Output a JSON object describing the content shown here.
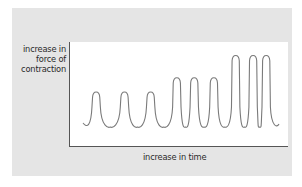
{
  "figure": {
    "y_axis_label_lines": [
      "increase in",
      "force of",
      "contraction"
    ],
    "x_axis_label": "increase in time",
    "colors": {
      "panel_background": "#e5e5e5",
      "plot_background": "#ffffff",
      "axis": "#555555",
      "curve": "#7a7a7a",
      "text": "#2a2a2a"
    }
  },
  "chart_data": {
    "type": "line",
    "title": "",
    "xlabel": "increase in time",
    "ylabel": "increase in force of contraction",
    "grid": false,
    "legend": null,
    "series": [
      {
        "name": "force of contraction",
        "peaks": [
          {
            "index": 1,
            "x_rel": 0.12,
            "height_rel": 0.4
          },
          {
            "index": 2,
            "x_rel": 0.25,
            "height_rel": 0.4
          },
          {
            "index": 3,
            "x_rel": 0.37,
            "height_rel": 0.4
          },
          {
            "index": 4,
            "x_rel": 0.49,
            "height_rel": 0.56
          },
          {
            "index": 5,
            "x_rel": 0.57,
            "height_rel": 0.56
          },
          {
            "index": 6,
            "x_rel": 0.66,
            "height_rel": 0.56
          },
          {
            "index": 7,
            "x_rel": 0.76,
            "height_rel": 0.81
          },
          {
            "index": 8,
            "x_rel": 0.84,
            "height_rel": 0.81
          },
          {
            "index": 9,
            "x_rel": 0.9,
            "height_rel": 0.81
          }
        ]
      }
    ],
    "groups": [
      {
        "peaks": 3,
        "relative_amplitude": "low"
      },
      {
        "peaks": 3,
        "relative_amplitude": "medium"
      },
      {
        "peaks": 3,
        "relative_amplitude": "high"
      }
    ]
  }
}
